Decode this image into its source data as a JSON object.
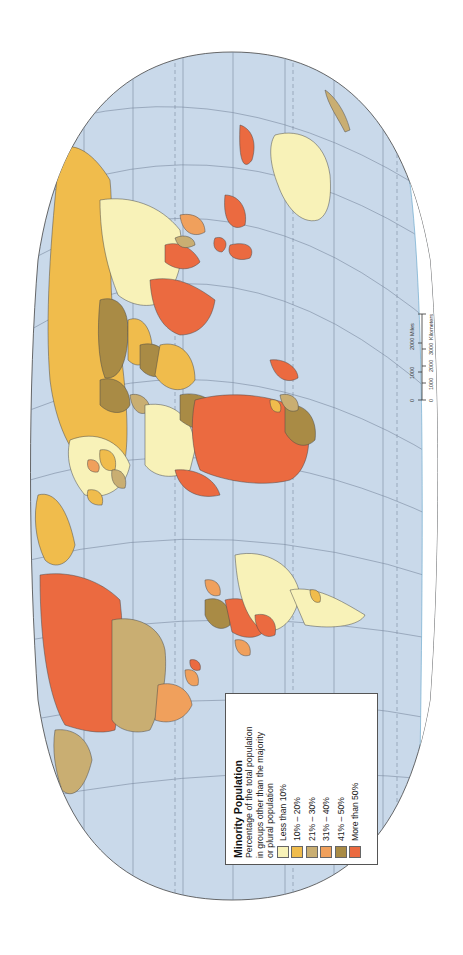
{
  "map": {
    "title": "Minority Population",
    "orientation": "rotated 90° counter-clockwise (north at left)",
    "projection": "elliptical world projection",
    "ocean_color": "#C9D9EA",
    "graticule_color": "#6B7C93",
    "regions": [
      {
        "name": "Russia",
        "category": "10% – 20%"
      },
      {
        "name": "China",
        "category": "Less than 10%"
      },
      {
        "name": "Kazakhstan",
        "category": "41% – 50%"
      },
      {
        "name": "India",
        "category": "More than 50%"
      },
      {
        "name": "Indonesia",
        "category": "More than 50%"
      },
      {
        "name": "Philippines",
        "category": "More than 50%"
      },
      {
        "name": "Australia",
        "category": "Less than 10%"
      },
      {
        "name": "Iran",
        "category": "41% – 50%"
      },
      {
        "name": "Saudi Arabia",
        "category": "10% – 20%"
      },
      {
        "name": "Africa (central / east)",
        "category": "More than 50%"
      },
      {
        "name": "Algeria / North Africa",
        "category": "Less than 10%"
      },
      {
        "name": "Sudan",
        "category": "41% – 50%"
      },
      {
        "name": "South Africa",
        "category": "41% – 50%"
      },
      {
        "name": "Madagascar",
        "category": "More than 50%"
      },
      {
        "name": "Europe (various)",
        "category": "Less than 10%"
      },
      {
        "name": "Greenland",
        "category": "10% – 20%"
      },
      {
        "name": "Canada",
        "category": "More than 50%"
      },
      {
        "name": "United States",
        "category": "21% – 30%"
      },
      {
        "name": "Mexico",
        "category": "31% – 40%"
      },
      {
        "name": "Brazil",
        "category": "Less than 10%"
      },
      {
        "name": "Argentina",
        "category": "Less than 10%"
      },
      {
        "name": "Peru / Bolivia",
        "category": "More than 50%"
      },
      {
        "name": "Colombia",
        "category": "41% – 50%"
      },
      {
        "name": "Alaska",
        "category": "21% – 30%"
      },
      {
        "name": "New Zealand",
        "category": "21% – 30%"
      }
    ]
  },
  "legend": {
    "title": "Minority Population",
    "subtitle_lines": [
      "Percentage of the total population",
      "in groups other than the majority",
      "or plural population"
    ],
    "items": [
      {
        "label": "Less than 10%",
        "color": "#F8F2B8"
      },
      {
        "label": "10% – 20%",
        "color": "#F0BC4C"
      },
      {
        "label": "21% – 30%",
        "color": "#C9AE72"
      },
      {
        "label": "31% – 40%",
        "color": "#F0A05C"
      },
      {
        "label": "41% – 50%",
        "color": "#A98B45"
      },
      {
        "label": "More than 50%",
        "color": "#EB6A40"
      }
    ]
  },
  "scale_bar": {
    "miles_label": "Miles",
    "km_label": "Kilometers",
    "miles_ticks": [
      "0",
      "1000",
      "2000"
    ],
    "km_ticks": [
      "0",
      "1000",
      "2000",
      "3000"
    ]
  }
}
